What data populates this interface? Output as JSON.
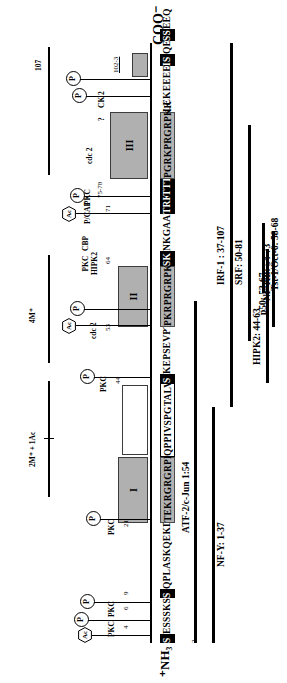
{
  "figure": {
    "type": "protein-domain-map",
    "termini": {
      "n_terminus": "⁺NH₃",
      "c_terminus": "COO⁻"
    },
    "residue_end_label": "107",
    "sequence_segments": [
      {
        "id": "seg1",
        "text": "S",
        "style": "inverted"
      },
      {
        "id": "seg2",
        "text": "ESSSKS",
        "style": "plain"
      },
      {
        "id": "seg3",
        "text": "S",
        "style": "inverted"
      },
      {
        "id": "seg4",
        "text": "QPLASKQEKDG",
        "style": "plain"
      },
      {
        "id": "seg5",
        "text": "TEKRGRGRPRK",
        "style": "shaded"
      },
      {
        "id": "seg6",
        "text": "QPPIVSPGTALVG",
        "style": "open"
      },
      {
        "id": "seg7",
        "text": "S",
        "style": "inverted"
      },
      {
        "id": "seg8",
        "text": "KEPSEVPT",
        "style": "plain"
      },
      {
        "id": "seg9",
        "text": "PKRPRGRPKG",
        "style": "shaded"
      },
      {
        "id": "seg10",
        "text": "SK",
        "style": "inverted"
      },
      {
        "id": "seg11",
        "text": "NKGAAK",
        "style": "plain"
      },
      {
        "id": "seg12",
        "text": "TRK",
        "style": "inverted"
      },
      {
        "id": "seg13",
        "text": "TTT",
        "style": "inverted"
      },
      {
        "id": "seg14",
        "text": "PGRKPRGRPKK",
        "style": "shaded"
      },
      {
        "id": "seg15",
        "text": "LEKEEEEG",
        "style": "plain"
      },
      {
        "id": "seg16",
        "text": "IS",
        "style": "inverted"
      },
      {
        "id": "seg17",
        "text": "QE",
        "style": "plain"
      },
      {
        "id": "seg18",
        "text": "SS",
        "style": "inverted"
      },
      {
        "id": "seg19",
        "text": "EEQ",
        "style": "plain"
      }
    ],
    "domains": [
      {
        "label": "I",
        "range": "AT-hook I"
      },
      {
        "label": "",
        "range": "spacer"
      },
      {
        "label": "II",
        "range": "AT-hook II"
      },
      {
        "label": "III",
        "range": "AT-hook III"
      }
    ],
    "residue_numbers": [
      {
        "value": "2",
        "underline": false
      },
      {
        "value": "4",
        "underline": false
      },
      {
        "value": "6",
        "underline": false
      },
      {
        "value": "9",
        "underline": false
      },
      {
        "value": "21",
        "underline": false
      },
      {
        "value": "44",
        "underline": false
      },
      {
        "value": "53",
        "underline": false
      },
      {
        "value": "64",
        "underline": false
      },
      {
        "value": "71",
        "underline": false
      },
      {
        "value": "75-78",
        "underline": false
      },
      {
        "value": "78",
        "underline": false
      },
      {
        "value": "102-3",
        "underline": true
      }
    ],
    "modifications": [
      {
        "type": "Ac",
        "glyph": "Ac",
        "shape": "hexagon"
      },
      {
        "type": "P",
        "glyph": "P",
        "shape": "circle"
      },
      {
        "type": "P",
        "glyph": "P",
        "shape": "circle"
      },
      {
        "type": "P",
        "glyph": "P",
        "shape": "circle"
      },
      {
        "type": "P",
        "glyph": "P",
        "shape": "circle"
      },
      {
        "type": "Ac",
        "glyph": "Ac",
        "shape": "hexagon"
      },
      {
        "type": "P",
        "glyph": "P",
        "shape": "circle"
      },
      {
        "type": "Ac",
        "glyph": "Ac",
        "shape": "hexagon"
      },
      {
        "type": "P",
        "glyph": "P",
        "shape": "circle"
      },
      {
        "type": "P",
        "glyph": "P",
        "shape": "circle"
      },
      {
        "type": "P",
        "glyph": "P",
        "shape": "circle"
      }
    ],
    "enzyme_callouts": [
      {
        "text": "PKC",
        "residue": "4"
      },
      {
        "text": "PKC",
        "residue": "6"
      },
      {
        "text": "PKC",
        "residue": "9"
      },
      {
        "text": "PKC",
        "residue": "21"
      },
      {
        "text": "PKC",
        "residue": "44"
      },
      {
        "text": "cdc 2",
        "residue": "53"
      },
      {
        "text": "PKC\nHIPK2",
        "residue": "64"
      },
      {
        "text": "CBP",
        "residue": "64"
      },
      {
        "text": "P/CAF",
        "residue": "71"
      },
      {
        "text": "PKC",
        "residue": "75-78"
      },
      {
        "text": "cdc 2",
        "residue": "78"
      },
      {
        "text": "CK 2",
        "residue": "102-3"
      },
      {
        "text": "?",
        "residue": "102-3"
      }
    ],
    "methylation_spans": [
      {
        "label": "2M⁺ + 1Ac"
      },
      {
        "label": "4M⁺"
      }
    ],
    "interaction_partners": [
      {
        "label": "NF-Y: 1-37"
      },
      {
        "label": "ATF-2/c-Jun  1:54"
      },
      {
        "label": "IRF-1 : 37-107"
      },
      {
        "label": "SRF: 50-81"
      },
      {
        "label": "HIPK2: 44-63"
      },
      {
        "label": "NF-KB: 54-73"
      },
      {
        "label": "p50: 53-67"
      },
      {
        "label": "Tst-1/Oct-6: 58-68"
      }
    ],
    "colors": {
      "at_hook_fill": "#b0b0b0",
      "at_hook_stroke": "#3c3c3c",
      "modified_residue": "#000000",
      "background": "#ffffff",
      "line": "#000000"
    }
  }
}
